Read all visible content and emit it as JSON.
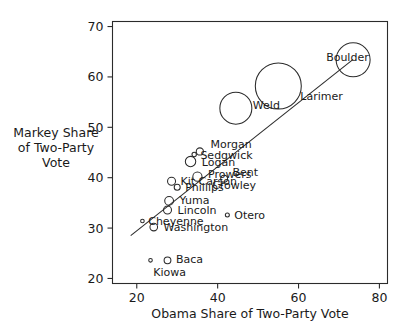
{
  "chart_data": {
    "type": "scatter",
    "title": "",
    "xlabel": "Obama Share of Two-Party Vote",
    "ylabel": "Markey Share of Two-Party Vote",
    "ylabel_lines": [
      "Markey Share",
      "of Two-Party",
      "Vote"
    ],
    "xlim": [
      14,
      82
    ],
    "ylim": [
      19,
      71
    ],
    "xticks": [
      20,
      40,
      60,
      80
    ],
    "yticks": [
      20,
      30,
      40,
      50,
      60,
      70
    ],
    "grid": false,
    "legend": null,
    "bubble_encoding": "circle radius encodes county vote total",
    "trendline": {
      "label": "fitted regression line",
      "x": [
        18.5,
        73.5
      ],
      "y": [
        28.5,
        63.5
      ]
    },
    "points": [
      {
        "label": "Boulder",
        "x": 73.5,
        "y": 63.4,
        "r": 17.0,
        "label_dx": -44,
        "label_dy": 1
      },
      {
        "label": "Larimer",
        "x": 55.0,
        "y": 58.2,
        "r": 23.0,
        "label_dx": -1,
        "label_dy": 14
      },
      {
        "label": "Weld",
        "x": 44.5,
        "y": 53.8,
        "r": 16.0,
        "label_dx": 1,
        "label_dy": 1
      },
      {
        "label": "Morgan",
        "x": 35.6,
        "y": 45.2,
        "r": 3.6,
        "label_dx": 7,
        "label_dy": -3
      },
      {
        "label": "Sedgwick",
        "x": 34.2,
        "y": 44.6,
        "r": 2.2,
        "label_dx": 4,
        "label_dy": 4
      },
      {
        "label": "Logan",
        "x": 33.3,
        "y": 43.2,
        "r": 5.2,
        "label_dx": 6,
        "label_dy": 4
      },
      {
        "label": "Prowers",
        "x": 35.0,
        "y": 40.2,
        "r": 4.6,
        "label_dx": 6,
        "label_dy": 1
      },
      {
        "label": "Bent",
        "x": 41.6,
        "y": 39.8,
        "r": 3.4,
        "label_dx": 5,
        "label_dy": -3
      },
      {
        "label": "Kit Carson",
        "x": 28.6,
        "y": 39.3,
        "r": 4.0,
        "label_dx": 5,
        "label_dy": 4
      },
      {
        "label": "Phillips",
        "x": 30.0,
        "y": 38.1,
        "r": 3.0,
        "label_dx": 5,
        "label_dy": 4
      },
      {
        "label": "Crowley",
        "x": 38.6,
        "y": 37.8,
        "r": 0.0,
        "label_dx": 0,
        "label_dy": 0
      },
      {
        "label": "Yuma",
        "x": 28.0,
        "y": 35.4,
        "r": 4.4,
        "label_dx": 6,
        "label_dy": 3
      },
      {
        "label": "Lincoln",
        "x": 27.6,
        "y": 33.6,
        "r": 4.0,
        "label_dx": 6,
        "label_dy": 4
      },
      {
        "label": "Cheyenne",
        "x": 21.4,
        "y": 31.4,
        "r": 1.8,
        "label_dx": 4,
        "label_dy": 4
      },
      {
        "label": "Washington",
        "x": 24.2,
        "y": 30.2,
        "r": 3.8,
        "label_dx": 6,
        "label_dy": 4
      },
      {
        "label": "Otero",
        "x": 42.4,
        "y": 32.6,
        "r": 2.0,
        "label_dx": 5,
        "label_dy": 4
      },
      {
        "label": "Baca",
        "x": 27.6,
        "y": 23.6,
        "r": 3.4,
        "label_dx": 5,
        "label_dy": 3
      },
      {
        "label": "Kiowa",
        "x": 23.4,
        "y": 23.6,
        "r": 1.8,
        "label_dx": 1,
        "label_dy": 16
      }
    ]
  },
  "colors": {
    "background": "#ffffff",
    "ink": "#1a1a1a",
    "axis": "#2b2b2b",
    "marker_stroke": "#2b2b2b"
  }
}
